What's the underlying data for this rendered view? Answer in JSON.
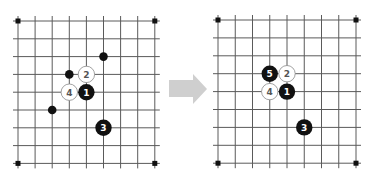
{
  "diagram": {
    "type": "go-board-sequence",
    "colors": {
      "background": "#ffffff",
      "grid_line": "#5a5a5a",
      "black_stone": "#111111",
      "white_stone": "#ffffff",
      "white_stone_outline": "#8a8a8a",
      "label_on_black": "#ffffff",
      "label_on_white": "#555555",
      "arrow": "#cfcfcf"
    },
    "grid": {
      "lines": 9
    },
    "boards": [
      {
        "name": "before",
        "origin": [
          18,
          21
        ],
        "spacing": [
          17.1,
          17.8
        ],
        "star_points": [
          [
            0,
            0
          ],
          [
            8,
            0
          ],
          [
            0,
            8
          ],
          [
            8,
            8
          ]
        ],
        "stones": [
          {
            "color": "black",
            "col": 5,
            "row": 2,
            "size": "small",
            "label": ""
          },
          {
            "color": "black",
            "col": 3,
            "row": 3,
            "size": "small",
            "label": ""
          },
          {
            "color": "white",
            "col": 4,
            "row": 3,
            "size": "large",
            "label": "2"
          },
          {
            "color": "white",
            "col": 3,
            "row": 4,
            "size": "large",
            "label": "4"
          },
          {
            "color": "black",
            "col": 4,
            "row": 4,
            "size": "large",
            "label": "1"
          },
          {
            "color": "black",
            "col": 2,
            "row": 5,
            "size": "small",
            "label": ""
          },
          {
            "color": "black",
            "col": 5,
            "row": 6,
            "size": "large",
            "label": "3"
          }
        ]
      },
      {
        "name": "after",
        "origin": [
          218,
          20
        ],
        "spacing": [
          17.25,
          17.9
        ],
        "star_points": [
          [
            0,
            0
          ],
          [
            8,
            0
          ],
          [
            0,
            8
          ],
          [
            8,
            8
          ]
        ],
        "stones": [
          {
            "color": "black",
            "col": 3,
            "row": 3,
            "size": "large",
            "label": "5"
          },
          {
            "color": "white",
            "col": 4,
            "row": 3,
            "size": "large",
            "label": "2"
          },
          {
            "color": "white",
            "col": 3,
            "row": 4,
            "size": "large",
            "label": "4"
          },
          {
            "color": "black",
            "col": 4,
            "row": 4,
            "size": "large",
            "label": "1"
          },
          {
            "color": "black",
            "col": 5,
            "row": 6,
            "size": "large",
            "label": "3"
          }
        ]
      }
    ],
    "arrow": {
      "direction": "right",
      "icon": "right-arrow-icon"
    }
  }
}
